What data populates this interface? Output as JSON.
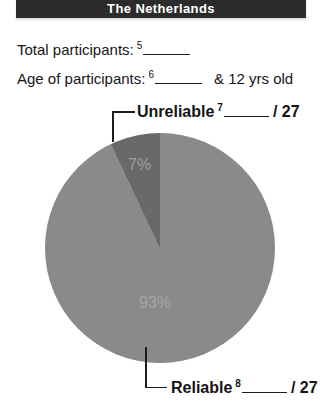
{
  "header": {
    "title": "The Netherlands",
    "bg_color": "#2b2b2b",
    "text_color": "#ffffff"
  },
  "form": {
    "line1": {
      "label": "Total participants:",
      "footnote": "5"
    },
    "line2": {
      "label": "Age of participants:",
      "footnote": "6",
      "suffix": "& 12 yrs old"
    }
  },
  "chart_data": {
    "type": "pie",
    "title": "The Netherlands",
    "labels_inside": true,
    "total_denominator": 27,
    "slices": [
      {
        "label": "Reliable",
        "value_pct": 93,
        "display": "93%",
        "color": "#8a8a8a",
        "footnote": "8",
        "denominator_text": "/ 27",
        "callout_position": "bottom"
      },
      {
        "label": "Unreliable",
        "value_pct": 7,
        "display": "7%",
        "color": "#696969",
        "footnote": "7",
        "denominator_text": "/ 27",
        "callout_position": "top"
      }
    ]
  }
}
